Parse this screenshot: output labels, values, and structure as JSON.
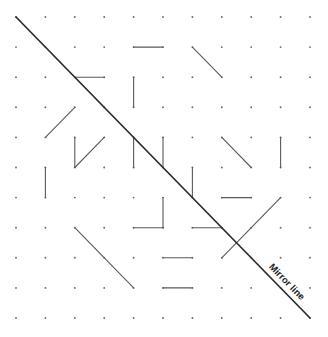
{
  "grid": {
    "columns": 11,
    "rows": 11,
    "origin_x": 16,
    "origin_y": 17,
    "step_x": 29.4,
    "step_y": 30.1
  },
  "mirror": {
    "from": [
      0,
      0
    ],
    "to": [
      10,
      10
    ],
    "label": "Mirror line",
    "label_center": [
      287,
      281
    ],
    "label_angle_deg": 45.7
  },
  "segments": [
    {
      "from": [
        4,
        1
      ],
      "to": [
        5,
        1
      ]
    },
    {
      "from": [
        6,
        1
      ],
      "to": [
        7,
        2
      ]
    },
    {
      "from": [
        2,
        2
      ],
      "to": [
        3,
        2
      ]
    },
    {
      "from": [
        4,
        2
      ],
      "to": [
        4,
        3
      ]
    },
    {
      "from": [
        1,
        4
      ],
      "to": [
        2,
        3
      ]
    },
    {
      "from": [
        2,
        4
      ],
      "to": [
        2,
        5
      ]
    },
    {
      "from": [
        2,
        5
      ],
      "to": [
        3,
        4
      ]
    },
    {
      "from": [
        4,
        4
      ],
      "to": [
        4,
        5
      ]
    },
    {
      "from": [
        5,
        4
      ],
      "to": [
        5,
        5
      ]
    },
    {
      "from": [
        7,
        4
      ],
      "to": [
        8,
        5
      ]
    },
    {
      "from": [
        9,
        4
      ],
      "to": [
        9,
        5
      ]
    },
    {
      "from": [
        1,
        5
      ],
      "to": [
        1,
        6
      ]
    },
    {
      "from": [
        6,
        5
      ],
      "to": [
        6,
        6
      ]
    },
    {
      "from": [
        5,
        6
      ],
      "to": [
        5,
        7
      ]
    },
    {
      "from": [
        4,
        7
      ],
      "to": [
        5,
        7
      ]
    },
    {
      "from": [
        7,
        6
      ],
      "to": [
        8,
        6
      ]
    },
    {
      "from": [
        9,
        6
      ],
      "to": [
        7,
        8
      ]
    },
    {
      "from": [
        6,
        7
      ],
      "to": [
        7,
        7
      ]
    },
    {
      "from": [
        2,
        7
      ],
      "to": [
        4,
        9
      ]
    },
    {
      "from": [
        5,
        8
      ],
      "to": [
        6,
        8
      ]
    },
    {
      "from": [
        5,
        9
      ],
      "to": [
        6,
        9
      ]
    }
  ],
  "colors": {
    "dot": "#6a6a6a",
    "segment": "#5a5a5a",
    "mirror": "#2b2b2b",
    "label": "#1e1e1e"
  }
}
